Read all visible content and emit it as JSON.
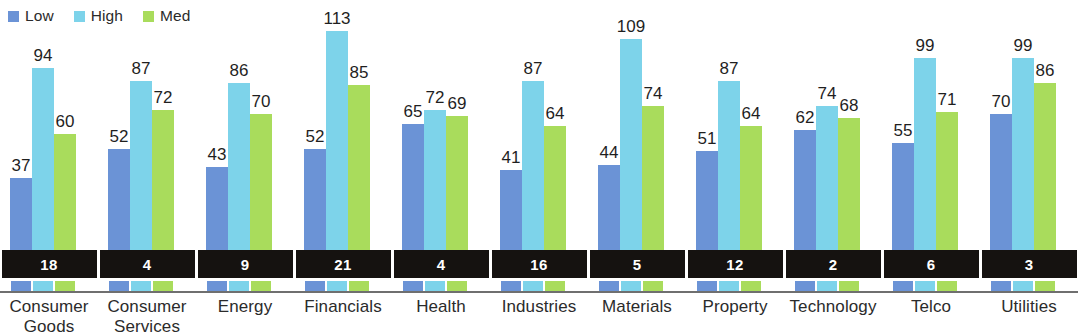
{
  "legend": {
    "items": [
      {
        "label": "Low",
        "color": "#6b93d6"
      },
      {
        "label": "High",
        "color": "#7dd3ea"
      },
      {
        "label": "Med",
        "color": "#a9dc5c"
      }
    ]
  },
  "colors": {
    "low": "#6b93d6",
    "high": "#7dd3ea",
    "med": "#a9dc5c",
    "band_background": "#151210",
    "band_text": "#ffffff",
    "axis_line": "#6f6f6f",
    "label_text": "#2b2b2b",
    "background": "#ffffff"
  },
  "chart_data": {
    "type": "bar",
    "title": "",
    "subtitle": "",
    "xlabel": "",
    "ylabel": "",
    "grid": false,
    "legend_position": "top-left",
    "ylim": [
      0,
      120
    ],
    "categories": [
      "Consumer Goods",
      "Consumer Services",
      "Energy",
      "Financials",
      "Health",
      "Industries",
      "Materials",
      "Property",
      "Technology",
      "Telco",
      "Utilities"
    ],
    "category_lines": [
      [
        "Consumer",
        "Goods"
      ],
      [
        "Consumer",
        "Services"
      ],
      [
        "Energy"
      ],
      [
        "Financials"
      ],
      [
        "Health"
      ],
      [
        "Industries"
      ],
      [
        "Materials"
      ],
      [
        "Property"
      ],
      [
        "Technology"
      ],
      [
        "Telco"
      ],
      [
        "Utilities"
      ]
    ],
    "series": [
      {
        "name": "Low",
        "values": [
          37,
          52,
          43,
          52,
          65,
          41,
          44,
          51,
          62,
          55,
          70
        ]
      },
      {
        "name": "High",
        "values": [
          94,
          87,
          86,
          113,
          72,
          87,
          109,
          87,
          74,
          99,
          99
        ]
      },
      {
        "name": "Med",
        "values": [
          60,
          72,
          70,
          85,
          69,
          64,
          74,
          64,
          68,
          71,
          86
        ]
      }
    ],
    "counts": [
      18,
      4,
      9,
      21,
      4,
      16,
      5,
      12,
      2,
      6,
      3
    ],
    "counts_label": "",
    "annotations": []
  }
}
